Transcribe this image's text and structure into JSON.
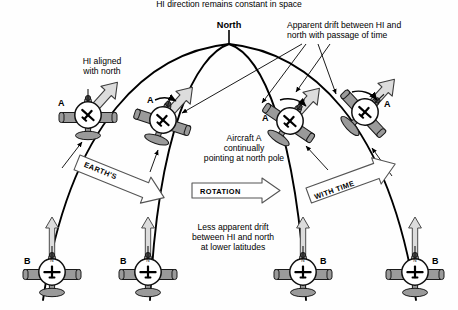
{
  "figure": {
    "title_lines": [
      "HI direction remains constant in space"
    ],
    "background_color": "#fefefe",
    "ink_color": "#000000",
    "aircraft_fill": "#9a9a9a",
    "arrow_fill": "#d8d8d8"
  },
  "labels": {
    "north": "North",
    "hi_aligned": "HI aligned\nwith north",
    "apparent_drift": "Apparent drift between HI and\nnorth with passage of time",
    "aircraft_a_note": "Aircraft A\ncontinually\npointing at north pole",
    "less_drift": "Less apparent drift\nbetween HI and north\nat lower latitudes"
  },
  "banners": [
    {
      "text": "EARTH'S",
      "name": "earths-banner"
    },
    {
      "text": "ROTATION",
      "name": "rotation-banner"
    },
    {
      "text": "WITH TIME",
      "name": "with-time-banner"
    }
  ],
  "aircraft_upper": [
    {
      "id": "A1",
      "label": "A",
      "rotation_deg": 0,
      "x": 88,
      "y": 115,
      "hi_arrow_deg": -42
    },
    {
      "id": "A2",
      "label": "A",
      "rotation_deg": 18,
      "x": 163,
      "y": 120,
      "hi_arrow_deg": -42
    },
    {
      "id": "A3",
      "label": "A",
      "rotation_deg": 34,
      "x": 290,
      "y": 121,
      "hi_arrow_deg": -42
    },
    {
      "id": "A4",
      "label": "A",
      "rotation_deg": 47,
      "x": 365,
      "y": 112,
      "hi_arrow_deg": -42
    }
  ],
  "aircraft_lower": [
    {
      "id": "B1",
      "label": "B",
      "x": 52,
      "y": 272,
      "label_side": "left",
      "hi_letter": "N"
    },
    {
      "id": "B2",
      "label": "B",
      "x": 148,
      "y": 272,
      "label_side": "left",
      "hi_letter": "N"
    },
    {
      "id": "B3",
      "label": "B",
      "x": 303,
      "y": 272,
      "label_side": "right",
      "hi_letter": "N"
    },
    {
      "id": "B4",
      "label": "B",
      "x": 415,
      "y": 272,
      "label_side": "right",
      "hi_letter": "N"
    }
  ],
  "meridians": 4,
  "pole": {
    "x": 229,
    "y": 44,
    "tick_label": "North"
  }
}
